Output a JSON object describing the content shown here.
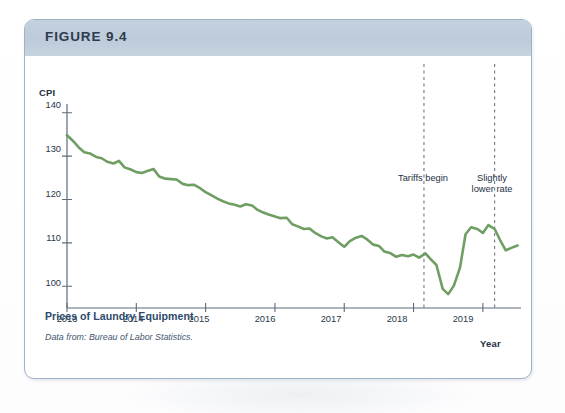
{
  "figure": {
    "header_label": "FIGURE 9.4",
    "caption_title": "Prices of Laundry Equipment",
    "caption_source": "Data from: Bureau of Labor Statistics.",
    "border_color": "#9fb2c6",
    "header_color": "#c3d1de"
  },
  "chart_data": {
    "type": "line",
    "title": "Prices of Laundry Equipment",
    "xlabel": "Year",
    "ylabel": "CPI",
    "ylim": [
      95,
      142
    ],
    "xlim": [
      2013.0,
      2019.55
    ],
    "yticks": [
      100,
      110,
      120,
      130,
      140
    ],
    "xticks": [
      2013,
      2014,
      2015,
      2016,
      2017,
      2018,
      2019
    ],
    "grid": false,
    "legend": null,
    "line_color": "#6f9e63",
    "line_width": 2.6,
    "annotations": [
      {
        "text": "Tariffs begin",
        "x": 2018.15,
        "kind": "vertical-dashed-line",
        "label_x": 2017.85,
        "label_y": 122
      },
      {
        "text": "Slightly\nlower rate",
        "x": 2019.17,
        "kind": "vertical-dashed-line",
        "label_x": 2019.2,
        "label_y": 122
      }
    ],
    "series": [
      {
        "name": "CPI of laundry equipment",
        "x": [
          2013.0,
          2013.08,
          2013.17,
          2013.25,
          2013.33,
          2013.42,
          2013.5,
          2013.58,
          2013.67,
          2013.75,
          2013.83,
          2013.92,
          2014.0,
          2014.08,
          2014.17,
          2014.25,
          2014.33,
          2014.42,
          2014.5,
          2014.58,
          2014.67,
          2014.75,
          2014.83,
          2014.92,
          2015.0,
          2015.08,
          2015.17,
          2015.25,
          2015.33,
          2015.42,
          2015.5,
          2015.58,
          2015.67,
          2015.75,
          2015.83,
          2015.92,
          2016.0,
          2016.08,
          2016.17,
          2016.25,
          2016.33,
          2016.42,
          2016.5,
          2016.58,
          2016.67,
          2016.75,
          2016.83,
          2016.92,
          2017.0,
          2017.08,
          2017.17,
          2017.25,
          2017.33,
          2017.42,
          2017.5,
          2017.58,
          2017.67,
          2017.75,
          2017.83,
          2017.92,
          2018.0,
          2018.08,
          2018.17,
          2018.25,
          2018.33,
          2018.42,
          2018.5,
          2018.58,
          2018.67,
          2018.75,
          2018.83,
          2018.92,
          2019.0,
          2019.08,
          2019.17,
          2019.25,
          2019.33,
          2019.42,
          2019.5
        ],
        "y": [
          134.8,
          133.6,
          132.0,
          130.9,
          130.6,
          129.8,
          129.5,
          128.7,
          128.3,
          128.9,
          127.4,
          126.9,
          126.3,
          126.1,
          126.6,
          127.0,
          125.3,
          124.8,
          124.7,
          124.6,
          123.6,
          123.3,
          123.4,
          122.6,
          121.7,
          121.0,
          120.2,
          119.6,
          119.1,
          118.8,
          118.4,
          118.9,
          118.6,
          117.6,
          117.0,
          116.5,
          116.1,
          115.7,
          115.8,
          114.3,
          113.8,
          113.2,
          113.3,
          112.3,
          111.5,
          111.0,
          111.3,
          110.1,
          109.1,
          110.4,
          111.2,
          111.6,
          110.8,
          109.6,
          109.3,
          108.0,
          107.6,
          106.8,
          107.2,
          106.9,
          107.3,
          106.6,
          107.6,
          106.2,
          104.9,
          99.4,
          98.2,
          100.1,
          104.3,
          112.0,
          113.6,
          113.2,
          112.3,
          114.1,
          113.2,
          110.6,
          108.3,
          108.9,
          109.4
        ]
      }
    ]
  },
  "axes": {
    "cpi_label": "CPI",
    "year_label": "Year",
    "ytick_labels": [
      "140",
      "130",
      "120",
      "110",
      "100"
    ],
    "xtick_labels": [
      "2013",
      "2014",
      "2015",
      "2016",
      "2017",
      "2018",
      "2019"
    ]
  },
  "annotations": {
    "tariffs": "Tariffs begin",
    "slightly_lower": "Slightly\nlower rate"
  }
}
